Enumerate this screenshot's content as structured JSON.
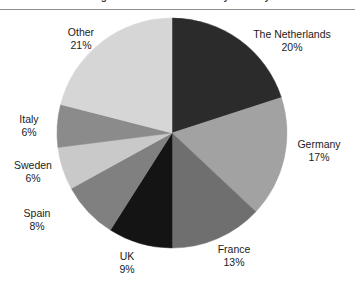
{
  "header": {
    "cropped_title": "Diagram 5.1: Market share by country",
    "rule_color": "#8d8d8d"
  },
  "chart_data": {
    "type": "pie",
    "title": "",
    "subtitle": "",
    "xlabel": "",
    "ylabel": "",
    "legend_position": "none",
    "labels_position": "outside",
    "start_angle_deg": 0,
    "direction": "clockwise",
    "units": "percent",
    "categories": [
      "The Netherlands",
      "Germany",
      "France",
      "UK",
      "Spain",
      "Sweden",
      "Italy",
      "Other"
    ],
    "values": [
      20,
      17,
      13,
      9,
      8,
      6,
      6,
      21
    ],
    "value_labels": [
      "20%",
      "17%",
      "13%",
      "9%",
      "8%",
      "6%",
      "6%",
      "21%"
    ],
    "colors": [
      "#2b2b2b",
      "#a2a2a2",
      "#6f6f6f",
      "#141414",
      "#808080",
      "#c9c9c9",
      "#8b8b8b",
      "#d6d6d6"
    ],
    "slices": [
      {
        "name": "The Netherlands",
        "value": 20,
        "value_label": "20%",
        "color": "#2b2b2b"
      },
      {
        "name": "Germany",
        "value": 17,
        "value_label": "17%",
        "color": "#a2a2a2"
      },
      {
        "name": "France",
        "value": 13,
        "value_label": "13%",
        "color": "#6f6f6f"
      },
      {
        "name": "UK",
        "value": 9,
        "value_label": "9%",
        "color": "#141414"
      },
      {
        "name": "Spain",
        "value": 8,
        "value_label": "8%",
        "color": "#808080"
      },
      {
        "name": "Sweden",
        "value": 6,
        "value_label": "6%",
        "color": "#c9c9c9"
      },
      {
        "name": "Italy",
        "value": 6,
        "value_label": "6%",
        "color": "#8b8b8b"
      },
      {
        "name": "Other",
        "value": 21,
        "value_label": "21%",
        "color": "#d6d6d6"
      }
    ],
    "total": 100
  },
  "geometry": {
    "center_x": 172,
    "center_y": 122,
    "radius": 115
  }
}
